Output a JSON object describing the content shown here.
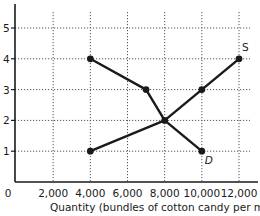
{
  "chart_data": {
    "type": "line",
    "title": "",
    "xlabel": "Quantity (bundles of cotton candy per month)",
    "ylabel": "",
    "xlim": [
      0,
      12000
    ],
    "ylim": [
      0,
      5
    ],
    "x_ticks": [
      "0",
      "2,000",
      "4,000",
      "6,000",
      "8,000",
      "10,000",
      "12,000"
    ],
    "y_ticks": [
      "1",
      "2",
      "3",
      "4",
      "5"
    ],
    "grid": true,
    "series": [
      {
        "name": "D",
        "points": [
          {
            "x": 4000,
            "y": 4
          },
          {
            "x": 7000,
            "y": 3
          },
          {
            "x": 8000,
            "y": 2
          },
          {
            "x": 10000,
            "y": 1
          }
        ]
      },
      {
        "name": "S",
        "points": [
          {
            "x": 4000,
            "y": 1
          },
          {
            "x": 8000,
            "y": 2
          },
          {
            "x": 10000,
            "y": 3
          },
          {
            "x": 12000,
            "y": 4
          }
        ]
      }
    ],
    "annotations": [
      {
        "text": "S",
        "x": 12000,
        "y": 4
      },
      {
        "text": "D",
        "x": 10000,
        "y": 1
      }
    ]
  }
}
